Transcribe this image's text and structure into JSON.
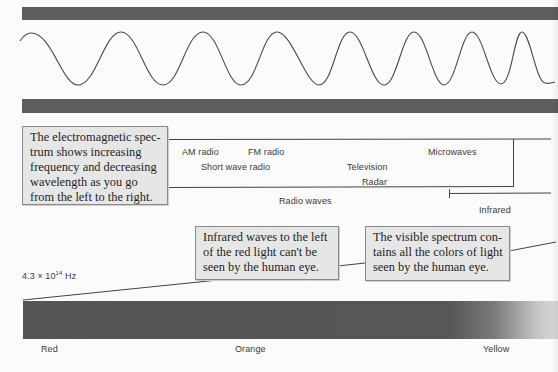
{
  "wave_panel": {
    "description": "sine wave with decreasing wavelength between two dark bars",
    "colors": {
      "bar": "#5e5e5e",
      "wave": "#4a4a4a"
    }
  },
  "callouts": {
    "em_spectrum": {
      "lines": [
        "The electromagnetic spec-",
        "trum shows increasing",
        "frequency and decreasing",
        "wavelength as you go",
        "from the left to the right."
      ]
    },
    "infrared": {
      "lines": [
        "Infrared waves to the left",
        "of the red light can't be",
        "seen by the human eye."
      ]
    },
    "visible": {
      "lines": [
        "The visible spectrum con-",
        "tains all the colors of light",
        "seen by the human eye."
      ]
    }
  },
  "bands": {
    "am_radio": "AM radio",
    "fm_radio": "FM radio",
    "short_wave_radio": "Short wave radio",
    "television": "Television",
    "radar": "Radar",
    "microwaves": "Microwaves",
    "radio_waves": "Radio waves",
    "infrared": "Infrared"
  },
  "frequency_label": {
    "mantissa": "4.3 × 10",
    "exponent": "14",
    "unit": " Hz"
  },
  "spectrum_colors": {
    "red": "Red",
    "orange": "Orange",
    "yellow": "Yellow"
  }
}
